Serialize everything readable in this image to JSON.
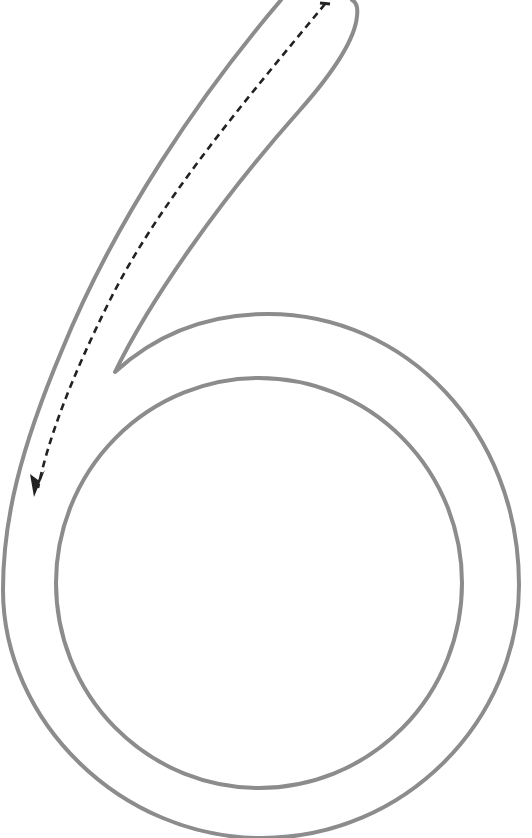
{
  "worksheet": {
    "glyph": "6",
    "description": "Outlined numeral six tracing guide with dashed stroke-direction arrow",
    "colors": {
      "background": "#ffffff",
      "outline": "#8c8c8c",
      "guide": "#222222"
    },
    "outline_stroke_width": 4,
    "guide": {
      "style": "dashed",
      "direction": "top-right to lower-left",
      "start": [
        325,
        4
      ],
      "end": [
        34,
        496
      ],
      "arrowhead": "arrow-down-left-icon"
    }
  }
}
